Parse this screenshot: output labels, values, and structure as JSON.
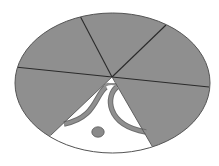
{
  "diagram": {
    "type": "sectored-ellipse",
    "colors": {
      "background": "#ffffff",
      "sector_fill": "#8f8f8f",
      "sector_line": "#2a2a2a",
      "outline": "#555555",
      "wedge_fill": "#ffffff",
      "ornament_fill": "#8a8a8a",
      "ornament_stroke": "#4a4a4a"
    },
    "ellipse": {
      "cx": 112.5,
      "cy": 83,
      "rx": 97.5,
      "ry": 70
    },
    "apex": {
      "x": 112,
      "y": 77
    },
    "dividers": [
      {
        "name": "top",
        "x": 79,
        "y": 14
      },
      {
        "name": "upper-right",
        "x": 166,
        "y": 25
      },
      {
        "name": "right",
        "x": 209,
        "y": 87
      },
      {
        "name": "lower-right",
        "x": 152,
        "y": 146
      },
      {
        "name": "lower-left",
        "x": 51,
        "y": 135
      },
      {
        "name": "left",
        "x": 15,
        "y": 67
      }
    ],
    "sectors": [
      {
        "name": "sector-top-left",
        "fill": "gray"
      },
      {
        "name": "sector-top-right",
        "fill": "gray"
      },
      {
        "name": "sector-right",
        "fill": "gray"
      },
      {
        "name": "sector-lower-right",
        "fill": "gray"
      },
      {
        "name": "sector-bottom",
        "fill": "white"
      },
      {
        "name": "sector-left",
        "fill": "gray"
      }
    ],
    "ornaments": {
      "left_arc": "curved band from near apex sweeping down-left to the wedge's left edge",
      "right_arc": "mirrored curved band sweeping down-right to the wedge's right edge",
      "dot": {
        "cx": 98,
        "cy": 132,
        "rx": 6,
        "ry": 5
      }
    }
  }
}
